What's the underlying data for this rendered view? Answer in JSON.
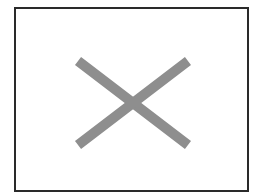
{
  "placeholder": {
    "icon": "x-mark-icon",
    "stroke_color": "#8e8e8e",
    "border_color": "#2a2a2a",
    "background": "#ffffff"
  }
}
